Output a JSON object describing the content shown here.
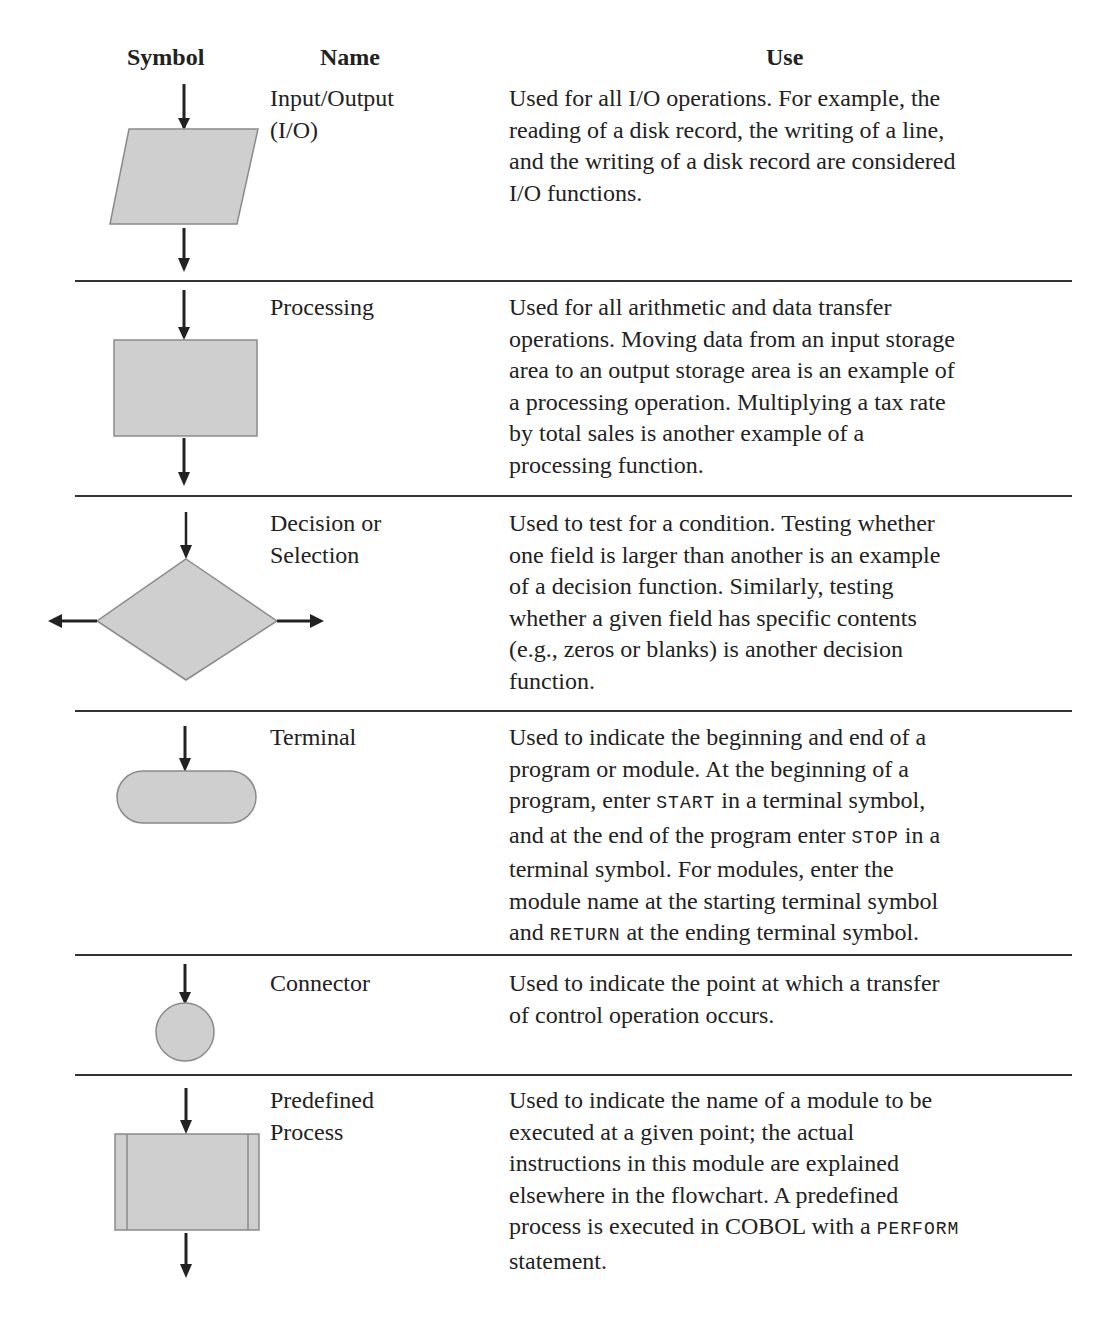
{
  "table": {
    "headers": {
      "symbol": "Symbol",
      "name": "Name",
      "use": "Use"
    },
    "rows": [
      {
        "symbol_icon": "parallelogram-io-icon",
        "name_line1": "Input/Output",
        "name_line2": "(I/O)",
        "use": [
          "Used for all I/O operations. For example, the",
          "reading of a disk record, the writing of a line,",
          "and the writing of a disk record are considered",
          "I/O functions."
        ]
      },
      {
        "symbol_icon": "rectangle-process-icon",
        "name_line1": "Processing",
        "use": [
          "Used for all arithmetic and data transfer",
          "operations. Moving data from an input storage",
          "area to an output storage area is an example of",
          "a processing operation. Multiplying a tax rate",
          "by total sales is another example of a",
          "processing function."
        ]
      },
      {
        "symbol_icon": "diamond-decision-icon",
        "name_line1": "Decision or",
        "name_line2": "Selection",
        "use": [
          "Used to test for a condition. Testing whether",
          "one field is larger than another is an example",
          "of a decision function. Similarly, testing",
          "whether a given field has specific contents",
          "(e.g., zeros or blanks) is another decision",
          "function."
        ]
      },
      {
        "symbol_icon": "rounded-terminal-icon",
        "name_line1": "Terminal",
        "use_parts": {
          "l1": "Used to indicate the beginning and end of a",
          "l2": "program or module. At the beginning of a",
          "l3a": "program, enter ",
          "l3code": "START",
          "l3b": " in a terminal symbol,",
          "l4a": "and at the end of the program enter ",
          "l4code": "STOP",
          "l4b": " in a",
          "l5": "terminal symbol. For modules, enter the",
          "l6": "module name at the starting terminal symbol",
          "l7a": "and ",
          "l7code": "RETURN",
          "l7b": " at the ending terminal symbol."
        }
      },
      {
        "symbol_icon": "circle-connector-icon",
        "name_line1": "Connector",
        "use": [
          "Used to indicate the point at which a transfer",
          "of control operation occurs."
        ]
      },
      {
        "symbol_icon": "predefined-process-icon",
        "name_line1": "Predefined",
        "name_line2": "Process",
        "use_parts": {
          "l1": "Used to indicate the name of a module to be",
          "l2": "executed at a given point; the actual",
          "l3": "instructions in this module are explained",
          "l4": "elsewhere in the flowchart. A predefined",
          "l5a": "process is executed in COBOL with a ",
          "l5code": "PERFORM",
          "l6": "statement."
        }
      }
    ]
  },
  "colors": {
    "symbol_fill": "#cfcfcf",
    "symbol_stroke": "#8a8a8a",
    "rule": "#333333",
    "arrow": "#222222"
  }
}
